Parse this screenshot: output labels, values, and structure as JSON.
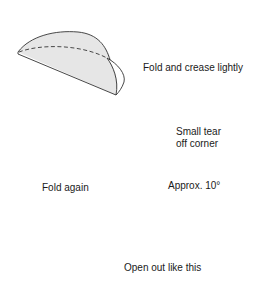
{
  "diagram": {
    "type": "instructional-steps",
    "colors": {
      "paper_fill": "#e6e6e6",
      "line": "#333333",
      "text": "#1a1a1a",
      "background": "#ffffff"
    },
    "steps": [
      {
        "id": "step-1",
        "figure": "semicircle folded paper with dashed crease",
        "label": "Fold and crease lightly"
      },
      {
        "id": "step-2",
        "figure": "quarter fold wedge with dashed outline of previous fold",
        "label": "Fold again",
        "annotations": {
          "tear": {
            "line1": "Small tear",
            "line2": "off corner"
          },
          "angle": "Approx. 10°"
        }
      },
      {
        "id": "step-3",
        "figure": "opened cone",
        "label": "Open out like this"
      }
    ]
  }
}
